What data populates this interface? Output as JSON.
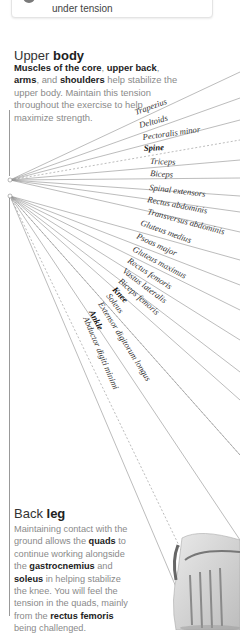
{
  "top_card": {
    "icon": "gray-circle-icon",
    "text": "under tension"
  },
  "upper_body": {
    "title_light": "Upper ",
    "title_bold": "body",
    "desc_parts": [
      {
        "t": "Muscles of the core",
        "b": true
      },
      {
        "t": ", ",
        "b": false
      },
      {
        "t": "upper back",
        "b": true
      },
      {
        "t": ", ",
        "b": false
      },
      {
        "t": "arms",
        "b": true
      },
      {
        "t": ", and ",
        "b": false
      },
      {
        "t": "shoulders",
        "b": true
      },
      {
        "t": " help stabilize the upper body. Maintain this tension throughout the exercise to help maximize strength.",
        "b": false
      }
    ]
  },
  "back_leg": {
    "title_light": "Back ",
    "title_bold": "leg",
    "desc_parts": [
      {
        "t": "Maintaining contact with the ground allows the ",
        "b": false
      },
      {
        "t": "quads",
        "b": true
      },
      {
        "t": " to continue working alongside the ",
        "b": false
      },
      {
        "t": "gastrocnemius",
        "b": true
      },
      {
        "t": " and ",
        "b": false
      },
      {
        "t": "soleus",
        "b": true
      },
      {
        "t": " in helping stabilize the knee. You will feel the tension in the quads, mainly from the ",
        "b": false
      },
      {
        "t": "rectus femoris",
        "b": true
      },
      {
        "t": " being challenged.",
        "b": false
      }
    ]
  },
  "upper_labels": [
    {
      "text": "Trapezius",
      "bold": false,
      "dashed": false
    },
    {
      "text": "Deltoids",
      "bold": false,
      "dashed": false
    },
    {
      "text": "Pectoralis minor",
      "bold": false,
      "dashed": false
    },
    {
      "text": "Spine",
      "bold": true,
      "dashed": true
    },
    {
      "text": "Triceps",
      "bold": false,
      "dashed": false
    },
    {
      "text": "Biceps",
      "bold": false,
      "dashed": false
    },
    {
      "text": "Spinal extensors",
      "bold": false,
      "dashed": false
    },
    {
      "text": "Rectus abdominis",
      "bold": false,
      "dashed": false
    },
    {
      "text": "Transversus abdominis",
      "bold": false,
      "dashed": false
    }
  ],
  "lower_labels": [
    {
      "text": "Gluteus medius",
      "bold": false,
      "dashed": false
    },
    {
      "text": "Psoas major",
      "bold": false,
      "dashed": false
    },
    {
      "text": "Gluteus maximus",
      "bold": false,
      "dashed": false
    },
    {
      "text": "Rectus femoris",
      "bold": false,
      "dashed": false
    },
    {
      "text": "Vastus lateralis",
      "bold": false,
      "dashed": false
    },
    {
      "text": "Biceps femoris",
      "bold": false,
      "dashed": false
    },
    {
      "text": "Knee",
      "bold": true,
      "dashed": true
    },
    {
      "text": "Soleus",
      "bold": false,
      "dashed": false
    },
    {
      "text": "Extensor digitorum longus",
      "bold": false,
      "dashed": false
    },
    {
      "text": "Ankle",
      "bold": true,
      "dashed": true
    },
    {
      "text": "Abductor digiti minimi",
      "bold": false,
      "dashed": false
    }
  ],
  "colors": {
    "line": "#8f8f8f",
    "muted_text": "#8a8a8a",
    "strong_text": "#222222"
  }
}
